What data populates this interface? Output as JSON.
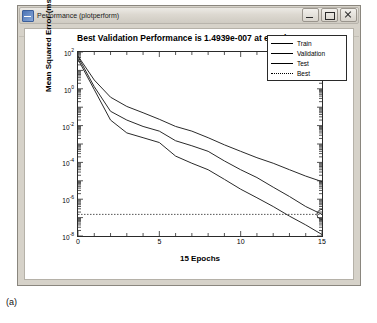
{
  "window": {
    "title": "Performance (plotperform)",
    "icon": "matlab-figure-icon",
    "buttons": [
      {
        "name": "minimize-button",
        "glyph": "minimize"
      },
      {
        "name": "maximize-button",
        "glyph": "maximize"
      },
      {
        "name": "close-button",
        "glyph": "close"
      }
    ]
  },
  "caption": "(a)",
  "chart_data": {
    "type": "line",
    "title": "Best Validation Performance is 1.4939e-007 at epoch 15",
    "xlabel": "15 Epochs",
    "ylabel": "Mean Squared Error  (mse)",
    "xlim": [
      0,
      15
    ],
    "ylim": [
      1e-08,
      100.0
    ],
    "yscale": "log",
    "xticks": [
      0,
      5,
      10,
      15
    ],
    "yticks": [
      "10^2",
      "10^0",
      "10^-2",
      "10^-4",
      "10^-6",
      "10^-8"
    ],
    "ytick_labels": [
      "10",
      "10",
      "10",
      "10",
      "10",
      "10"
    ],
    "ytick_exponents": [
      "2",
      "0",
      "-2",
      "-4",
      "-6",
      "-8"
    ],
    "grid": false,
    "legend_position": "top-right",
    "legend": [
      {
        "name": "Train",
        "color": "#2a2a2a",
        "style": "solid"
      },
      {
        "name": "Validation",
        "color": "#2a2a2a",
        "style": "solid"
      },
      {
        "name": "Test",
        "color": "#2a2a2a",
        "style": "solid"
      },
      {
        "name": "Best",
        "color": "#2a2a2a",
        "style": "dotted"
      }
    ],
    "best_marker": {
      "epoch": 15,
      "value": 1.4939e-07,
      "label": "best-validation-circle"
    },
    "x": [
      0,
      1,
      2,
      3,
      4,
      5,
      6,
      7,
      8,
      9,
      10,
      11,
      12,
      13,
      14,
      15
    ],
    "series": [
      {
        "name": "Train",
        "values": [
          40,
          0.9,
          0.02,
          0.004,
          0.0022,
          0.0012,
          0.00022,
          9e-05,
          4e-05,
          1.2e-05,
          3.5e-06,
          1.2e-06,
          4e-07,
          1.2e-07,
          4e-08,
          1.2e-08
        ]
      },
      {
        "name": "Validation",
        "values": [
          55,
          1.3,
          0.06,
          0.02,
          0.009,
          0.005,
          0.0015,
          0.0008,
          0.0004,
          0.00012,
          4e-05,
          1.5e-05,
          4.5e-06,
          1.4e-06,
          4e-07,
          1.5e-07
        ]
      },
      {
        "name": "Test",
        "values": [
          60,
          3.0,
          0.35,
          0.11,
          0.05,
          0.022,
          0.009,
          0.005,
          0.0022,
          0.0009,
          0.0004,
          0.00018,
          9e-05,
          4e-05,
          1.8e-05,
          9e-06
        ]
      },
      {
        "name": "Best",
        "values": [
          1.4939e-07,
          1.4939e-07,
          1.4939e-07,
          1.4939e-07,
          1.4939e-07,
          1.4939e-07,
          1.4939e-07,
          1.4939e-07,
          1.4939e-07,
          1.4939e-07,
          1.4939e-07,
          1.4939e-07,
          1.4939e-07,
          1.4939e-07,
          1.4939e-07,
          1.4939e-07
        ]
      }
    ]
  }
}
